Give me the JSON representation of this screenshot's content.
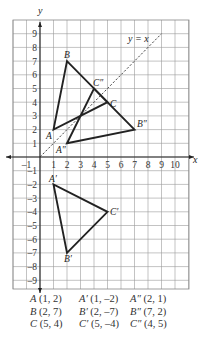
{
  "chart_data": {
    "type": "diagram",
    "title": "",
    "xlabel": "x",
    "ylabel": "y",
    "xlim": [
      -2,
      11
    ],
    "ylim": [
      -9.7,
      9.8
    ],
    "grid": true,
    "x_ticks": [
      "-1",
      "1",
      "2",
      "3",
      "4",
      "5",
      "6",
      "7",
      "8",
      "9",
      "10"
    ],
    "y_ticks": [
      "9",
      "8",
      "7",
      "6",
      "5",
      "4",
      "3",
      "2",
      "1",
      "-1",
      "-2",
      "-3",
      "-4",
      "-5",
      "-6",
      "-7",
      "-8",
      "-9"
    ],
    "reflection_line": {
      "label": "y = x",
      "from": [
        0,
        0
      ],
      "to": [
        9,
        9
      ],
      "style": "dashed"
    },
    "triangles": [
      {
        "name": "ABC",
        "vertices": [
          {
            "label": "A",
            "x": 1,
            "y": 2
          },
          {
            "label": "B",
            "x": 2,
            "y": 7
          },
          {
            "label": "C",
            "x": 5,
            "y": 4
          }
        ]
      },
      {
        "name": "A'B'C'",
        "vertices": [
          {
            "label": "A′",
            "x": 1,
            "y": -2
          },
          {
            "label": "B′",
            "x": 2,
            "y": -7
          },
          {
            "label": "C′",
            "x": 5,
            "y": -4
          }
        ]
      },
      {
        "name": "A''B''C''",
        "vertices": [
          {
            "label": "A″",
            "x": 2,
            "y": 1
          },
          {
            "label": "B″",
            "x": 7,
            "y": 2
          },
          {
            "label": "C″",
            "x": 4,
            "y": 5
          }
        ]
      }
    ]
  },
  "axes": {
    "x_label": "x",
    "y_label": "y"
  },
  "reflection_label": "y = x",
  "vertex_labels": {
    "A": "A",
    "B": "B",
    "C": "C",
    "A1": "A′",
    "B1": "B′",
    "C1": "C′",
    "A2": "A″",
    "B2": "B″",
    "C2": "C″"
  },
  "legend": {
    "rows": [
      [
        {
          "name": "A",
          "coords": "(1, 2)"
        },
        {
          "name": "A′",
          "coords": "(1, –2)"
        },
        {
          "name": "A″",
          "coords": "(2, 1)"
        }
      ],
      [
        {
          "name": "B",
          "coords": "(2, 7)"
        },
        {
          "name": "B′",
          "coords": "(2, –7)"
        },
        {
          "name": "B″",
          "coords": "(7, 2)"
        }
      ],
      [
        {
          "name": "C",
          "coords": "(5, 4)"
        },
        {
          "name": "C′",
          "coords": "(5, –4)"
        },
        {
          "name": "C″",
          "coords": "(4, 5)"
        }
      ]
    ]
  }
}
